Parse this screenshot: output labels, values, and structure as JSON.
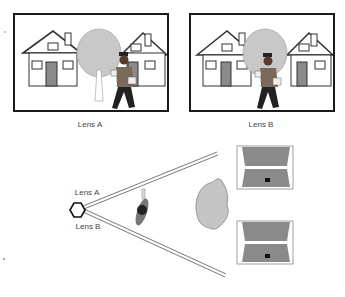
{
  "panels": [
    {
      "label": "Lens A"
    },
    {
      "label": "Lens B"
    }
  ],
  "diagram": {
    "lens_a_label": "Lens A",
    "lens_b_label": "Lens B"
  },
  "colors": {
    "frame": "#1a1a1a",
    "tree": "#b8b8b8",
    "screen": "#8a8a8a",
    "rock": "#c4c4c4",
    "line": "#555555"
  }
}
